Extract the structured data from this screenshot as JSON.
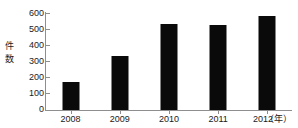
{
  "chart_data": {
    "type": "bar",
    "title": "",
    "subtitle": "",
    "categories": [
      "2008",
      "2009",
      "2010",
      "2011",
      "2012"
    ],
    "values": [
      175,
      335,
      532,
      525,
      580
    ],
    "xlabel": "",
    "ylabel": "件数",
    "x_unit": "（年）",
    "ylim": [
      0,
      600
    ],
    "yticks": [
      0,
      100,
      200,
      300,
      400,
      500,
      600
    ],
    "ytick_labels": [
      "0",
      "100",
      "200",
      "300",
      "400",
      "500",
      "600"
    ],
    "grid": false,
    "legend": null,
    "bar_color": "#0a0a0a",
    "axis_color": "#8e8e8e",
    "text_color": "#1a1a1a",
    "background": "#ffffff",
    "y_axis_title_chars": [
      "件",
      "数"
    ]
  }
}
